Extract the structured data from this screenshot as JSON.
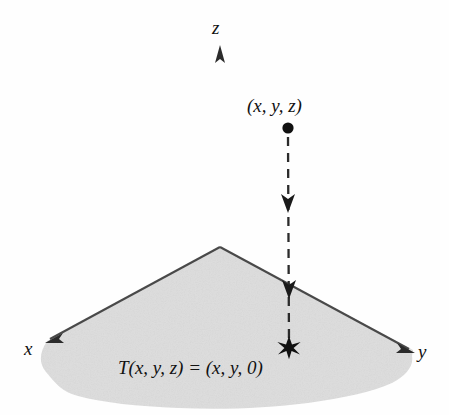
{
  "figure": {
    "kind": "3d-coordinate-projection-diagram",
    "background_color": "#fefefe",
    "ink_color": "#2b2b2b",
    "plane_fill_color": "#dcdcdc",
    "plane_edge_color": "#4a4a4a"
  },
  "axes": {
    "z": {
      "label": "z",
      "origin": [
        220,
        248
      ],
      "tip": [
        220,
        46
      ],
      "arrow": "up"
    },
    "x": {
      "label": "x",
      "origin": [
        220,
        248
      ],
      "tip": [
        46,
        342
      ],
      "arrow": "down-left"
    },
    "y": {
      "label": "y",
      "origin": [
        220,
        248
      ],
      "tip": [
        413,
        351
      ],
      "arrow": "down-right"
    }
  },
  "point": {
    "label": "(x, y, z)",
    "marker": "filled-circle",
    "position": [
      288,
      128
    ]
  },
  "image_point": {
    "marker": "star",
    "position": [
      289,
      348
    ]
  },
  "projection_line": {
    "style": "dashed",
    "from": [
      288,
      136
    ],
    "to": [
      289,
      344
    ],
    "arrowheads": [
      203,
      289
    ],
    "arrow_direction": "down"
  },
  "equation": {
    "text": "T(x, y, z) = (x, y, 0)",
    "parts": {
      "map_name": "T",
      "domain_tuple": "(x, y, z)",
      "relation": "=",
      "image_tuple": "(x, y, 0)"
    }
  }
}
